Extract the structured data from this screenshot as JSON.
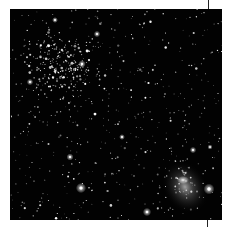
{
  "image": {
    "subject": "starfield",
    "description": "Astronomical starfield with a dense open star cluster upper-left and a bright nebula lower-right",
    "background_color": "#020202",
    "frame": {
      "x": 10,
      "y": 9,
      "width": 212,
      "height": 211
    },
    "cluster": {
      "cx": 52,
      "cy": 58,
      "radius": 40,
      "count": 260
    },
    "nebula": {
      "cx": 175,
      "cy": 178,
      "rx": 22,
      "ry": 28,
      "color": "#8a8a8a"
    },
    "field_star_count": 520,
    "bright_stars": [
      {
        "x": 71,
        "y": 179,
        "r": 3.2
      },
      {
        "x": 199,
        "y": 180,
        "r": 3.4
      },
      {
        "x": 137,
        "y": 203,
        "r": 2.6
      },
      {
        "x": 87,
        "y": 25,
        "r": 2.0
      },
      {
        "x": 72,
        "y": 55,
        "r": 2.3
      },
      {
        "x": 20,
        "y": 73,
        "r": 2.0
      },
      {
        "x": 45,
        "y": 11,
        "r": 1.8
      },
      {
        "x": 183,
        "y": 141,
        "r": 2.0
      },
      {
        "x": 112,
        "y": 128,
        "r": 1.8
      },
      {
        "x": 60,
        "y": 148,
        "r": 2.2
      },
      {
        "x": 200,
        "y": 138,
        "r": 1.6
      }
    ],
    "tick_marks": [
      {
        "position": "top",
        "x": 208
      },
      {
        "position": "bottom",
        "x": 207
      }
    ]
  }
}
